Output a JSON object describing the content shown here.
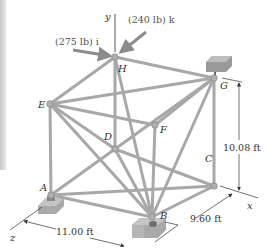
{
  "figure": {
    "axes": {
      "y": "y",
      "x": "x",
      "z": "z"
    },
    "forces": [
      {
        "label": "(275 lb) i",
        "node": "H",
        "direction": "+x"
      },
      {
        "label": "(240 lb) k",
        "node": "H",
        "direction": "+z"
      }
    ],
    "nodes": {
      "A": {
        "label": "A",
        "x": 51,
        "y": 195
      },
      "B": {
        "label": "B",
        "x": 152,
        "y": 217
      },
      "C": {
        "label": "C",
        "x": 214,
        "y": 186
      },
      "D": {
        "label": "D",
        "x": 115,
        "y": 149
      },
      "E": {
        "label": "E",
        "x": 50,
        "y": 104
      },
      "F": {
        "label": "F",
        "x": 155,
        "y": 125
      },
      "G": {
        "label": "G",
        "x": 214,
        "y": 78
      },
      "H": {
        "label": "H",
        "x": 115,
        "y": 57
      }
    },
    "members": [
      [
        "E",
        "A"
      ],
      [
        "H",
        "D"
      ],
      [
        "F",
        "B"
      ],
      [
        "G",
        "C"
      ],
      [
        "E",
        "H"
      ],
      [
        "H",
        "G"
      ],
      [
        "E",
        "F"
      ],
      [
        "F",
        "G"
      ],
      [
        "E",
        "G"
      ],
      [
        "A",
        "D"
      ],
      [
        "D",
        "C"
      ],
      [
        "A",
        "B"
      ],
      [
        "B",
        "C"
      ],
      [
        "D",
        "B"
      ],
      [
        "E",
        "D"
      ],
      [
        "E",
        "B"
      ],
      [
        "H",
        "B"
      ],
      [
        "G",
        "D"
      ],
      [
        "G",
        "B"
      ],
      [
        "A",
        "C"
      ]
    ],
    "dimensions": {
      "height": "10.08 ft",
      "depth": "9.60 ft",
      "width": "11.00 ft"
    },
    "supports": [
      "A",
      "B",
      "G"
    ]
  }
}
